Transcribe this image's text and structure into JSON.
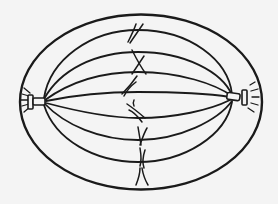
{
  "diagram": {
    "title": "Mitotic spindle at metaphase",
    "background": "#f4f4f4",
    "stroke_color": "#1a1a1a",
    "components": [
      {
        "name": "cell-boundary",
        "shape": "ellipse"
      },
      {
        "name": "left-centriole-pair",
        "shape": "centriole"
      },
      {
        "name": "right-centriole-pair",
        "shape": "centriole"
      },
      {
        "name": "spindle-fibers",
        "count": 8
      },
      {
        "name": "chromosomes",
        "count": 7,
        "arrangement": "metaphase plate"
      },
      {
        "name": "astral-rays-left"
      },
      {
        "name": "astral-rays-right"
      }
    ]
  }
}
